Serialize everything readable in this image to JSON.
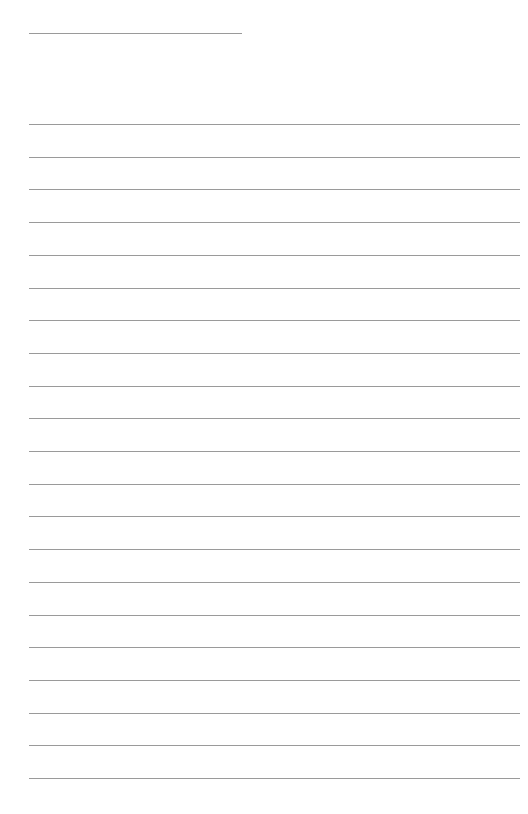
{
  "document": {
    "type": "lined-paper",
    "line_color": "#9a9a9a",
    "background": "#ffffff",
    "header_line": {
      "top": 33,
      "left": 29,
      "width": 213
    },
    "ruled_lines": {
      "count": 21,
      "first_top": 124,
      "spacing": 32.7,
      "left": 29,
      "width": 491
    }
  }
}
